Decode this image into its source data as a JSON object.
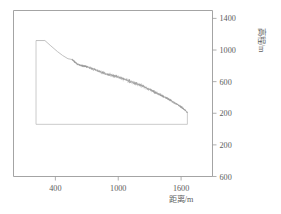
{
  "figure": {
    "background_color": "#ffffff",
    "axis_color": "#9a9a9a",
    "profile_color": "#b0b0b0",
    "particle_color": "#9e9e9e"
  },
  "chart_data": {
    "type": "line",
    "title": "",
    "subtitle": "",
    "xlabel": "距离/m",
    "ylabel": "高程/m",
    "xlim": [
      0,
      1900
    ],
    "ylim": [
      -600,
      1500
    ],
    "grid": false,
    "legend": null,
    "xticks": [
      400,
      1000,
      1600
    ],
    "xticklabels": [
      "400",
      "1000",
      "1600"
    ],
    "yticks": [
      1400,
      1000,
      600,
      200,
      -200,
      -600
    ],
    "yticklabels": [
      "1400",
      "1000",
      "600",
      "200",
      "200",
      "600"
    ],
    "series": [
      {
        "name": "slope-profile",
        "type": "line",
        "x": [
          215,
          215,
          300,
          350,
          420,
          470,
          520,
          560,
          610,
          660,
          700,
          760,
          820,
          880,
          940,
          1000,
          1060,
          1120,
          1180,
          1240,
          1300,
          1360,
          1420,
          1480,
          1540,
          1590,
          1630,
          1660
        ],
        "y": [
          1120,
          1120,
          1120,
          1060,
          980,
          930,
          890,
          880,
          820,
          800,
          790,
          760,
          730,
          700,
          680,
          660,
          630,
          600,
          570,
          540,
          500,
          460,
          420,
          380,
          330,
          290,
          250,
          210
        ]
      },
      {
        "name": "model-domain-outline",
        "type": "line",
        "x": [
          215,
          215,
          1660,
          1660
        ],
        "y": [
          1120,
          60,
          60,
          210
        ]
      }
    ],
    "particle_band": {
      "name": "debris-particles",
      "description": "dense scattered particles along the slope surface",
      "x_start": 560,
      "x_end": 1660,
      "count": 1400,
      "spread": 22
    },
    "annotations": []
  },
  "axes": {
    "x_axis_name": "distance-axis",
    "y_axis_name": "elevation-axis"
  }
}
